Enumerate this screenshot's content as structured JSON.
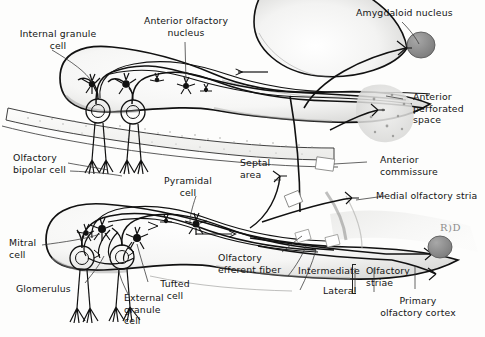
{
  "figure": {
    "signature": "R)D",
    "ink_color": "#111111",
    "tissue_fill": "#f2f2f0",
    "nucleus_fill": "#8e8e8e"
  },
  "labels": {
    "internal_granule_cell": "Internal granule\ncell",
    "anterior_olfactory_nucleus": "Anterior olfactory\nnucleus",
    "amygdaloid_nucleus": "Amygdaloid nucleus",
    "anterior_perforated_space": "Anterior\nperforated\nspace",
    "olfactory_bipolar_cell": "Olfactory\nbipolar cell",
    "pyramidal_cell": "Pyramidal\ncell",
    "septal_area": "Septal\narea",
    "anterior_commissure": "Anterior\ncommissure",
    "medial_olfactory_stria": "Medial olfactory stria",
    "mitral_cell": "Mitral\ncell",
    "glomerulus": "Glomerulus",
    "tufted_cell": "Tufted\ncell",
    "external_granule_cell": "External\ngranule\ncell",
    "olfactory_efferent_fiber": "Olfactory\nefferent fiber",
    "intermediate": "Intermediate",
    "lateral": "Lateral",
    "olfactory_striae": "Olfactory\nstriae",
    "primary_olfactory_cortex": "Primary\nolfactory cortex"
  }
}
